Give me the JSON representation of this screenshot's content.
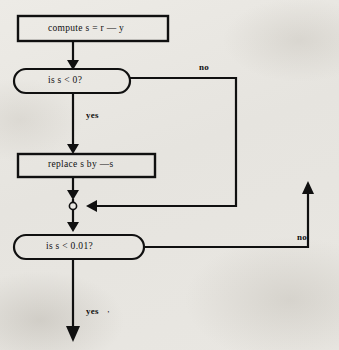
{
  "figure": {
    "type": "flowchart",
    "title": "",
    "background_color": "#e9e7e2",
    "line_color": "#101010",
    "nodes": [
      {
        "id": "compute",
        "shape": "rectangle",
        "label": "compute s = r — y",
        "x": 18,
        "y": 16,
        "w": 150,
        "h": 25
      },
      {
        "id": "decision_negative",
        "shape": "stadium",
        "label": "is s < 0?",
        "x": 14,
        "y": 69,
        "w": 116,
        "h": 24
      },
      {
        "id": "replace",
        "shape": "rectangle",
        "label": "replace s by —s",
        "x": 18,
        "y": 154,
        "w": 137,
        "h": 23
      },
      {
        "id": "junction",
        "shape": "circle",
        "label": "",
        "x": 80,
        "y": 206,
        "r": 3.5
      },
      {
        "id": "decision_tolerance",
        "shape": "stadium",
        "label": "is s < 0.01?",
        "x": 14,
        "y": 235,
        "w": 130,
        "h": 24
      }
    ],
    "edge_labels": [
      {
        "id": "no_first",
        "text": "no",
        "x": 199,
        "y": 62
      },
      {
        "id": "yes_first",
        "text": "yes",
        "x": 86,
        "y": 110
      },
      {
        "id": "no_second",
        "text": "no",
        "x": 297,
        "y": 232
      },
      {
        "id": "yes_second",
        "text": "yes",
        "x": 86,
        "y": 306
      }
    ],
    "tick_mark": {
      "text": "’",
      "x": 107,
      "y": 310
    },
    "edges": [
      {
        "from": "compute",
        "to": "decision_negative",
        "label": "",
        "path": "vertical"
      },
      {
        "from": "decision_negative",
        "to": "replace",
        "label": "yes",
        "path": "vertical"
      },
      {
        "from": "decision_negative",
        "to": "junction",
        "label": "no",
        "path": "right-down-left"
      },
      {
        "from": "replace",
        "to": "junction",
        "label": "",
        "path": "vertical"
      },
      {
        "from": "junction",
        "to": "decision_tolerance",
        "label": "",
        "path": "vertical"
      },
      {
        "from": "decision_tolerance",
        "to": "loop_back",
        "label": "no",
        "path": "right-up"
      },
      {
        "from": "decision_tolerance",
        "to": "exit",
        "label": "yes",
        "path": "vertical-down"
      }
    ]
  }
}
